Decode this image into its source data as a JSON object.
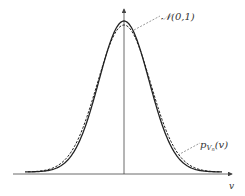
{
  "chart_data": {
    "type": "line",
    "title": "",
    "xlabel": "v",
    "ylabel": "",
    "series": [
      {
        "name": "N(0,1)",
        "style": "solid",
        "description": "standard normal density"
      },
      {
        "name": "p_{V_n}(v)",
        "style": "dashed",
        "description": "approximating density, slightly lower peak"
      }
    ],
    "annotations": [
      {
        "text": "𝒩(0,1)",
        "target": "solid curve near peak"
      },
      {
        "text": "p_{V_n}(v)",
        "target": "dashed curve on right tail"
      }
    ],
    "axes": {
      "x_label": "v",
      "y_axis": "vertical arrow at v=0",
      "ticks": "none"
    },
    "grid": false
  },
  "labels": {
    "normal": "𝒩(0,1)",
    "pv_main": "p",
    "pv_sub": "V",
    "pv_subsub": "n",
    "pv_arg": "(v)",
    "xaxis": "v"
  },
  "colors": {
    "line": "#222222",
    "axis": "#444444",
    "leader": "#555555"
  }
}
